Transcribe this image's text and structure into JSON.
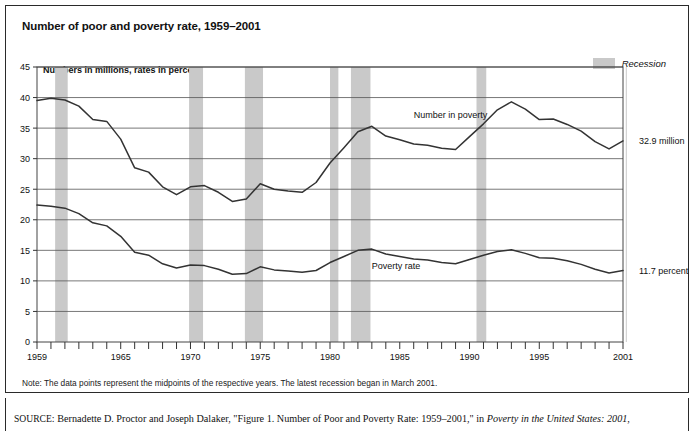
{
  "figure": {
    "title": "Number of poor and poverty rate, 1959–2001",
    "axis_caption": "Numbers in millions, rates in percent",
    "legend": {
      "label": "Recession",
      "swatch_color": "#c9c9c9"
    },
    "note": "Note: The data points represent the midpoints of the respective years. The latest recession began in March 2001.",
    "source": {
      "prefix": "SOURCE",
      "text": ": Bernadette D. Proctor and Joseph Dalaker, \"Figure 1. Number of Poor and Poverty Rate: 1959–2001,\" in ",
      "italic": "Poverty in the United States: 2001",
      "suffix": ","
    },
    "endpoint_labels": {
      "number": "32.9 million",
      "rate": "11.7 percent"
    }
  },
  "chart_data": {
    "type": "line",
    "title": "Number of poor and poverty rate, 1959–2001",
    "xlabel": "",
    "ylabel": "Numbers in millions, rates in percent",
    "xlim": [
      1959,
      2001
    ],
    "ylim": [
      0,
      45
    ],
    "ytick_step": 5,
    "yticks": [
      0,
      5,
      10,
      15,
      20,
      25,
      30,
      35,
      40,
      45
    ],
    "xticks": [
      1959,
      1960,
      1961,
      1962,
      1963,
      1964,
      1965,
      1966,
      1967,
      1968,
      1969,
      1970,
      1971,
      1972,
      1973,
      1974,
      1975,
      1976,
      1977,
      1978,
      1979,
      1980,
      1981,
      1982,
      1983,
      1984,
      1985,
      1986,
      1987,
      1988,
      1989,
      1990,
      1991,
      1992,
      1993,
      1994,
      1995,
      1996,
      1997,
      1998,
      1999,
      2000,
      2001
    ],
    "xtick_labels": [
      {
        "x": 1959,
        "label": "1959"
      },
      {
        "x": 1965,
        "label": "1965"
      },
      {
        "x": 1970,
        "label": "1970"
      },
      {
        "x": 1975,
        "label": "1975"
      },
      {
        "x": 1980,
        "label": "1980"
      },
      {
        "x": 1985,
        "label": "1985"
      },
      {
        "x": 1990,
        "label": "1990"
      },
      {
        "x": 1995,
        "label": "1995"
      },
      {
        "x": 2001,
        "label": "2001"
      }
    ],
    "grid": "horizontal",
    "legend_position": "top-right",
    "x": [
      1959,
      1960,
      1961,
      1962,
      1963,
      1964,
      1965,
      1966,
      1967,
      1968,
      1969,
      1970,
      1971,
      1972,
      1973,
      1974,
      1975,
      1976,
      1977,
      1978,
      1979,
      1980,
      1981,
      1982,
      1983,
      1984,
      1985,
      1986,
      1987,
      1988,
      1989,
      1990,
      1991,
      1992,
      1993,
      1994,
      1995,
      1996,
      1997,
      1998,
      1999,
      2000,
      2001
    ],
    "series": [
      {
        "name": "Number in poverty",
        "units": "millions",
        "annotation": "Number in poverty",
        "end_label": "32.9 million",
        "values": [
          39.5,
          39.9,
          39.6,
          38.6,
          36.4,
          36.1,
          33.2,
          28.5,
          27.8,
          25.4,
          24.1,
          25.4,
          25.6,
          24.5,
          23.0,
          23.4,
          25.9,
          25.0,
          24.7,
          24.5,
          26.1,
          29.3,
          31.8,
          34.4,
          35.3,
          33.7,
          33.1,
          32.4,
          32.2,
          31.7,
          31.5,
          33.6,
          35.7,
          38.0,
          39.3,
          38.1,
          36.4,
          36.5,
          35.6,
          34.5,
          32.8,
          31.6,
          32.9
        ]
      },
      {
        "name": "Poverty rate",
        "units": "percent",
        "annotation": "Poverty rate",
        "end_label": "11.7 percent",
        "values": [
          22.4,
          22.2,
          21.9,
          21.0,
          19.5,
          19.0,
          17.3,
          14.7,
          14.2,
          12.8,
          12.1,
          12.6,
          12.5,
          11.9,
          11.1,
          11.2,
          12.3,
          11.8,
          11.6,
          11.4,
          11.7,
          13.0,
          14.0,
          15.0,
          15.2,
          14.4,
          14.0,
          13.6,
          13.4,
          13.0,
          12.8,
          13.5,
          14.2,
          14.8,
          15.1,
          14.5,
          13.8,
          13.7,
          13.3,
          12.7,
          11.9,
          11.3,
          11.7
        ]
      }
    ],
    "recessions": [
      {
        "start": 1960.3,
        "end": 1961.2
      },
      {
        "start": 1969.9,
        "end": 1970.9
      },
      {
        "start": 1973.9,
        "end": 1975.2
      },
      {
        "start": 1980.0,
        "end": 1980.6
      },
      {
        "start": 1981.5,
        "end": 1982.9
      },
      {
        "start": 1990.5,
        "end": 1991.2
      },
      {
        "start": 2001.2,
        "end": 2001.9
      }
    ],
    "recession_color": "#c9c9c9",
    "line_color": "#333333"
  }
}
